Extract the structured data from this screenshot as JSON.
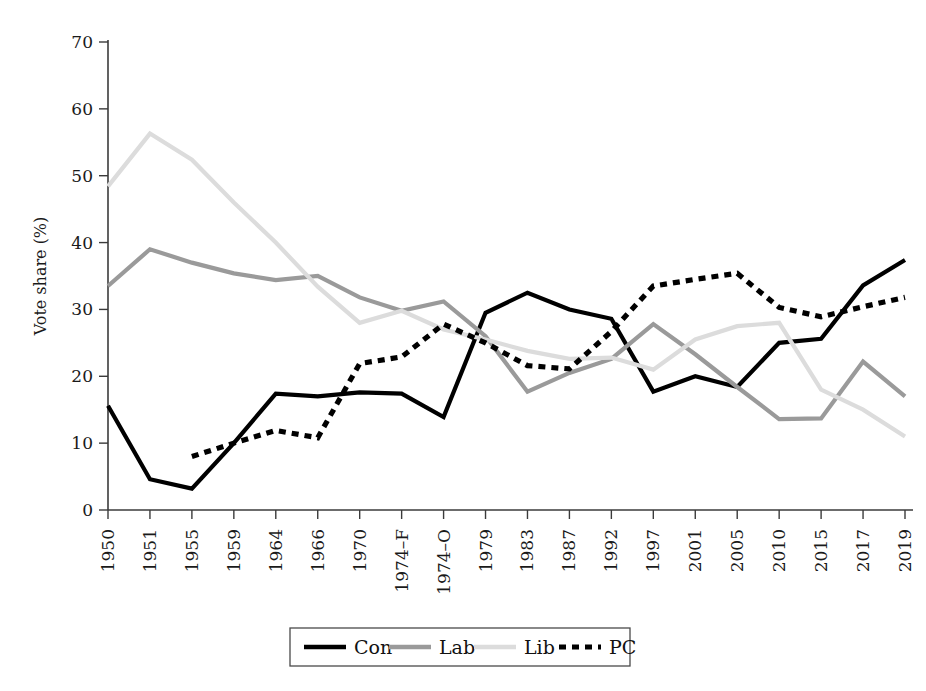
{
  "chart_data": {
    "type": "line",
    "title": "",
    "xlabel": "",
    "ylabel": "Vote share (%)",
    "ylim": [
      0,
      70
    ],
    "yticks": [
      0,
      10,
      20,
      30,
      40,
      50,
      60,
      70
    ],
    "grid": false,
    "legend_position": "bottom",
    "categories": [
      "1950",
      "1951",
      "1955",
      "1959",
      "1964",
      "1966",
      "1970",
      "1974–F",
      "1974–O",
      "1979",
      "1983",
      "1987",
      "1992",
      "1997",
      "2001",
      "2005",
      "2010",
      "2015",
      "2017",
      "2019"
    ],
    "series": [
      {
        "name": "Con",
        "style": "solid",
        "color": "#000000",
        "values": [
          15.6,
          4.6,
          3.2,
          10.0,
          17.4,
          17.0,
          17.6,
          17.4,
          13.9,
          29.5,
          32.5,
          30.0,
          28.6,
          17.7,
          20.0,
          18.4,
          25.0,
          25.6,
          33.6,
          37.4
        ]
      },
      {
        "name": "Lab",
        "style": "solid",
        "color": "#9a9a9a",
        "values": [
          33.5,
          39.0,
          37.0,
          35.4,
          34.4,
          35.0,
          31.8,
          29.8,
          31.2,
          26.0,
          17.7,
          20.5,
          22.6,
          27.8,
          23.3,
          18.4,
          13.6,
          13.7,
          22.2,
          17.0
        ]
      },
      {
        "name": "Lib",
        "style": "solid",
        "color": "#dcdcdc",
        "values": [
          48.4,
          56.3,
          52.4,
          46.0,
          40.0,
          33.4,
          28.0,
          29.8,
          27.0,
          25.5,
          23.8,
          22.6,
          22.8,
          21.0,
          25.5,
          27.5,
          28.0,
          18.0,
          15.0,
          11.0
        ]
      },
      {
        "name": "PC",
        "style": "dashed",
        "color": "#000000",
        "values": [
          null,
          null,
          8.0,
          10.0,
          11.9,
          10.8,
          21.9,
          22.9,
          27.8,
          25.0,
          21.6,
          21.1,
          26.7,
          33.5,
          34.5,
          35.4,
          30.3,
          28.9,
          30.4,
          31.8
        ]
      }
    ],
    "legend": [
      {
        "label": "Con",
        "style": "solid",
        "color": "#000000"
      },
      {
        "label": "Lab",
        "style": "solid",
        "color": "#9a9a9a"
      },
      {
        "label": "Lib",
        "style": "solid",
        "color": "#dcdcdc"
      },
      {
        "label": "PC",
        "style": "dashed",
        "color": "#000000"
      }
    ]
  },
  "axes": {
    "y_axis_title": "Vote share (%)"
  }
}
